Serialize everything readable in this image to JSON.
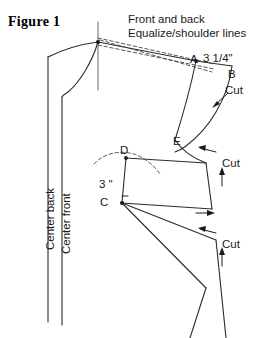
{
  "figure": {
    "title": "Figure 1",
    "notes": {
      "line1": "Front and back",
      "line2": "Equalize/shoulder lines"
    },
    "labels": {
      "point_a": "A",
      "dimension_a": "3 1/4\"",
      "point_b": "B",
      "point_c": "C",
      "point_d": "D",
      "point_e": "E",
      "dimension_d_to_c": "3 \"",
      "cut_upper": "Cut",
      "cut_middle": "Cut",
      "cut_lower": "Cut",
      "center_back": "Center back",
      "center_front": "Center front"
    },
    "colors": {
      "ink": "#1a1a1a",
      "line": "#2b2b2b",
      "guide": "#555555",
      "background": "#ffffff"
    }
  }
}
